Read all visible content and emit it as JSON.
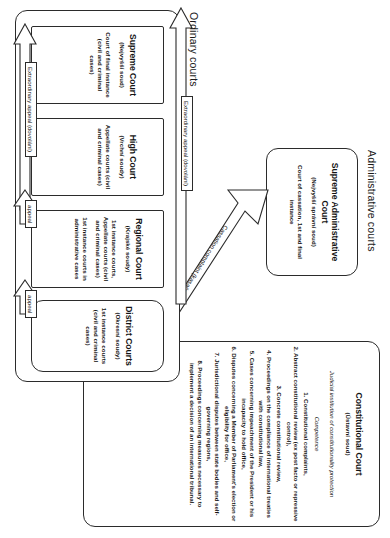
{
  "diagram": {
    "sections": [
      {
        "id": "constitutional",
        "label": ""
      },
      {
        "id": "administrative",
        "label": "Administrative courts"
      },
      {
        "id": "ordinary",
        "label": "Ordinary courts"
      }
    ]
  },
  "constitutional_court": {
    "name": "Constitutional Court",
    "native": "(Ústavní soud)",
    "subtitle": "Judicial institution of constitutionality protection",
    "competence_heading": "Competence",
    "competences": [
      "1. Constitutional complaints,",
      "2. Abstract constitutional review (ex post facto or repressive control),",
      "3. Concrete constitutional review,",
      "4. Proceedings on the compliance of international treaties with constitutional law,",
      "5. Cases concerning impeachment of the President or his incapacity to hold office,",
      "6. Disputes concerning a Member of Parliament's election or eligibility for office,",
      "7. Jurisdictional disputes between state bodies and self-governing regions,",
      "8. Proceedings concerning measures necessary to implement a decision of an international tribunal."
    ]
  },
  "administrative_courts": {
    "section_label": "Administrative courts",
    "supreme": {
      "name": "Supreme Administrative Court",
      "native": "(Nejvyšší správní soud)",
      "role": "Court of cassation, 1st and final instance"
    }
  },
  "ordinary_courts": {
    "section_label": "Ordinary courts",
    "courts": [
      {
        "name": "Supreme Court",
        "native": "(Nejvyšší soud)",
        "role": "Court of final instance (civil and criminal cases)",
        "role2": ""
      },
      {
        "name": "High Court",
        "native": "(Vrchní soudy)",
        "role": "Appellate courts (civil and criminal cases)",
        "role2": ""
      },
      {
        "name": "Regional Court",
        "native": "(Krajské soudy)",
        "role": "1st instance courts, Appellate courts (civil and criminal cases)",
        "role2": "1st instance courts in administrative cases"
      },
      {
        "name": "District Courts",
        "native": "(Okresní soudy)",
        "role": "1st instance courts (civil and criminal cases)",
        "role2": ""
      }
    ]
  },
  "connectors": {
    "extraordinary_appeal_top": "Extraordinary appeal (dovolání)",
    "extraordinary_appeal_bottom": "Extraordinary appeal (dovolání)",
    "appeal_high_regional": "appeal",
    "appeal_regional_district": "appeal",
    "cassation_complaint": "Cassation complaint (kasační stížnost)"
  },
  "colors": {
    "ink": "#2b2b2b",
    "paper": "#ffffff"
  }
}
